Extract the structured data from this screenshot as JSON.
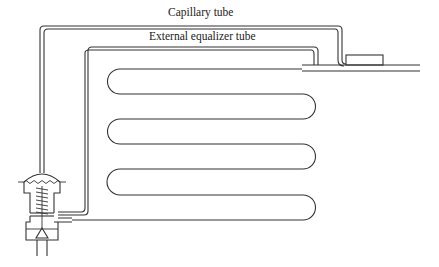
{
  "diagram": {
    "labels": {
      "capillary_tube": "Capillary tube",
      "external_equalizer_tube": "External equalizer tube"
    },
    "components": [
      "expansion-valve",
      "capillary-tube",
      "external-equalizer-tube",
      "evaporator-coil",
      "sensing-bulb",
      "suction-outlet-line"
    ],
    "colors": {
      "stroke": "#333333",
      "background": "#ffffff"
    }
  }
}
